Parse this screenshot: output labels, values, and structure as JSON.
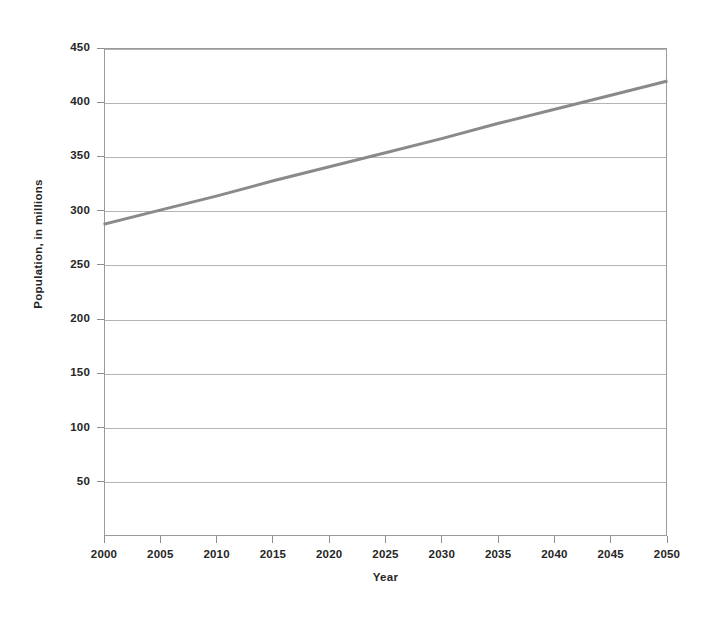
{
  "chart_data": {
    "type": "line",
    "title": "",
    "xlabel": "Year",
    "ylabel": "Population, in millions",
    "x": [
      2000,
      2005,
      2010,
      2015,
      2020,
      2025,
      2030,
      2035,
      2040,
      2045,
      2050
    ],
    "values": [
      288,
      301,
      314,
      328,
      341,
      354,
      367,
      381,
      394,
      407,
      420
    ],
    "series": [
      {
        "name": "Population",
        "values": [
          288,
          301,
          314,
          328,
          341,
          354,
          367,
          381,
          394,
          407,
          420
        ],
        "color": "#8a8a8a"
      }
    ],
    "xlim": [
      2000,
      2050
    ],
    "ylim": [
      0,
      450
    ],
    "xticks": [
      2000,
      2005,
      2010,
      2015,
      2020,
      2025,
      2030,
      2035,
      2040,
      2045,
      2050
    ],
    "xtick_labels": [
      "2000",
      "2005",
      "2010",
      "2015",
      "2020",
      "2025",
      "2030",
      "2035",
      "2040",
      "2045",
      "2050"
    ],
    "yticks": [
      50,
      100,
      150,
      200,
      250,
      300,
      350,
      400,
      450
    ],
    "ytick_labels": [
      "50",
      "100",
      "150",
      "200",
      "250",
      "300",
      "350",
      "400",
      "450"
    ],
    "grid": "horizontal",
    "legend": "none",
    "line_color": "#8a8a8a",
    "line_width": 3,
    "grid_color": "#b4b4b4",
    "axis_color": "#9a9a9a",
    "background": "#ffffff"
  }
}
